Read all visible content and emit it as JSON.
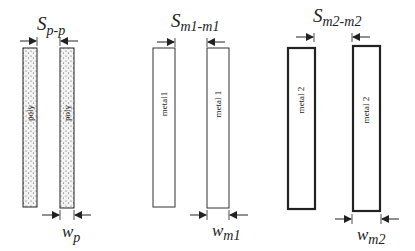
{
  "diagram": {
    "groups": [
      {
        "id": "poly",
        "spacing_label": {
          "main": "S",
          "sub": "p-p"
        },
        "width_label": {
          "main": "w",
          "sub": "p"
        },
        "bars": [
          {
            "label": "poly",
            "fill": "dotted"
          },
          {
            "label": "poly",
            "fill": "dotted"
          }
        ]
      },
      {
        "id": "metal1",
        "spacing_label": {
          "main": "S",
          "sub": "m1-m1"
        },
        "width_label": {
          "main": "w",
          "sub": "m1"
        },
        "bars": [
          {
            "label": "metal1",
            "fill": "none"
          },
          {
            "label": "metal 1",
            "fill": "none"
          }
        ]
      },
      {
        "id": "metal2",
        "spacing_label": {
          "main": "S",
          "sub": "m2-m2"
        },
        "width_label": {
          "main": "w",
          "sub": "m2"
        },
        "bars": [
          {
            "label": "metal 2",
            "fill": "none",
            "border": "thick"
          },
          {
            "label": "metal 2",
            "fill": "none",
            "border": "thick"
          }
        ]
      }
    ],
    "colors": {
      "stroke": "#222222",
      "background": "#ffffff",
      "dots": "#555555"
    }
  }
}
